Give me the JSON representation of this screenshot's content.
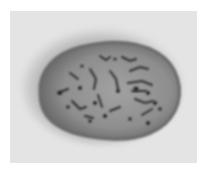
{
  "image": {
    "subject": "cell nucleus micrograph",
    "colors": {
      "background": "#ffffff",
      "field": "#e6e6e6",
      "halo": "#b8b8b8",
      "nucleus_rim": "#6e6e6e",
      "nucleus_fill": "#8c8c8c",
      "chromatin": "#2a2a2a"
    }
  }
}
